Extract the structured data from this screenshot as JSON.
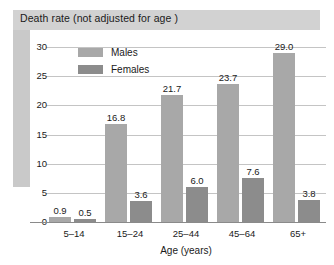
{
  "title": "Death rate (not adjusted for age )",
  "chart_data": {
    "type": "bar",
    "title": "Death rate (not adjusted for age )",
    "xlabel": "Age (years)",
    "ylabel": "",
    "categories": [
      "5–14",
      "15–24",
      "25–44",
      "45–64",
      "65+"
    ],
    "series": [
      {
        "name": "Males",
        "color": "#a8a8a8",
        "values": [
          0.9,
          16.8,
          21.7,
          23.7,
          29.0
        ],
        "labels": [
          "0.9",
          "16.8",
          "21.7",
          "23.7",
          "29.0"
        ]
      },
      {
        "name": "Females",
        "color": "#8c8c8c",
        "values": [
          0.5,
          3.6,
          6.0,
          7.6,
          3.8
        ],
        "labels": [
          "0.5",
          "3.6",
          "6.0",
          "7.6",
          "3.8"
        ]
      }
    ],
    "ylim": [
      0,
      30
    ],
    "yticks": [
      "0",
      "5",
      "10",
      "15",
      "20",
      "25",
      "30"
    ],
    "grid": true,
    "legend_position": "top-left-inside"
  },
  "colors": {
    "title_bar": "#d2d2d2",
    "left_band": "#c9c9c9",
    "males": "#a8a8a8",
    "females": "#8c8c8c",
    "gridline": "#c4c4c4"
  }
}
